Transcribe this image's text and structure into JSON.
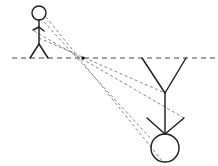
{
  "diagram": {
    "colors": {
      "background": "#ffffff",
      "figure_stroke": "#1a1a1a",
      "ray_stroke": "#777777",
      "mirror_line": "#444444",
      "pivot": "#000000"
    },
    "mirror_line": {
      "x1": 12,
      "y1": 58,
      "x2": 218,
      "y2": 58,
      "dash": "5 4"
    },
    "pivot": {
      "x": 83,
      "y": 58,
      "r": 1.6
    },
    "upright_figure": {
      "head": {
        "cx": 39,
        "cy": 13,
        "r": 7
      },
      "body": {
        "x1": 39,
        "y1": 20,
        "x2": 39,
        "y2": 44
      },
      "left_arm": {
        "x1": 39,
        "y1": 27,
        "x2": 33,
        "y2": 30
      },
      "right_arm": {
        "x1": 39,
        "y1": 27,
        "x2": 44,
        "y2": 31
      },
      "left_leg": {
        "x1": 39,
        "y1": 44,
        "x2": 30,
        "y2": 58
      },
      "right_leg": {
        "x1": 39,
        "y1": 44,
        "x2": 48,
        "y2": 58
      }
    },
    "inverted_figure": {
      "head": {
        "cx": 165,
        "cy": 148,
        "r": 14
      },
      "body": {
        "x1": 165,
        "y1": 93,
        "x2": 165,
        "y2": 134
      },
      "left_arm": {
        "x1": 165,
        "y1": 134,
        "x2": 147,
        "y2": 118
      },
      "right_arm": {
        "x1": 165,
        "y1": 134,
        "x2": 184,
        "y2": 118
      },
      "left_leg": {
        "x1": 165,
        "y1": 93,
        "x2": 142,
        "y2": 58
      },
      "right_leg": {
        "x1": 165,
        "y1": 93,
        "x2": 186,
        "y2": 58
      }
    },
    "rays": [
      {
        "x1": 46,
        "y1": 17,
        "x2": 163,
        "y2": 162
      },
      {
        "x1": 44,
        "y1": 22,
        "x2": 152,
        "y2": 140
      },
      {
        "x1": 34,
        "y1": 31,
        "x2": 184,
        "y2": 118
      },
      {
        "x1": 39,
        "y1": 38,
        "x2": 165,
        "y2": 93
      }
    ]
  }
}
